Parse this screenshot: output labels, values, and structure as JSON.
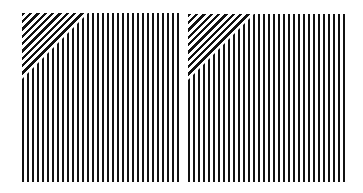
{
  "figure": {
    "colors": {
      "stripe": "#111111",
      "background": "#ffffff"
    },
    "panels": [
      {
        "id": "left",
        "x": 22,
        "y": 13,
        "width": 157,
        "height": 169,
        "triangle_size": 66
      },
      {
        "id": "right",
        "x": 188,
        "y": 14,
        "width": 157,
        "height": 168,
        "triangle_size": 66
      }
    ]
  }
}
